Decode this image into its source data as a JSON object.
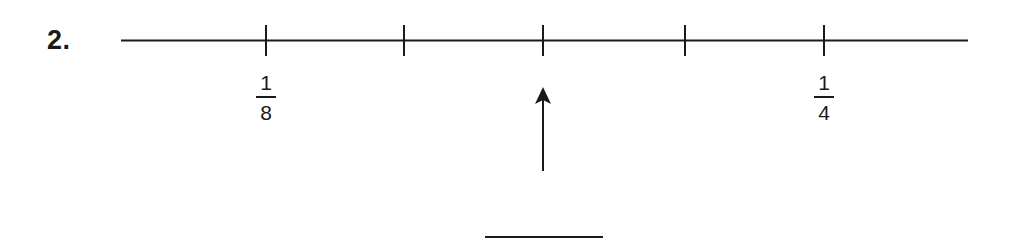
{
  "problem": {
    "number_label": "2."
  },
  "number_line": {
    "tick_count": 5,
    "labels": [
      {
        "tick_index": 0,
        "numerator": "1",
        "denominator": "8"
      },
      {
        "tick_index": 4,
        "numerator": "1",
        "denominator": "4"
      }
    ],
    "arrow_points_to_tick_index": 2,
    "answer_blank": ""
  },
  "colors": {
    "ink": "#1a1a1a",
    "background": "#ffffff"
  }
}
